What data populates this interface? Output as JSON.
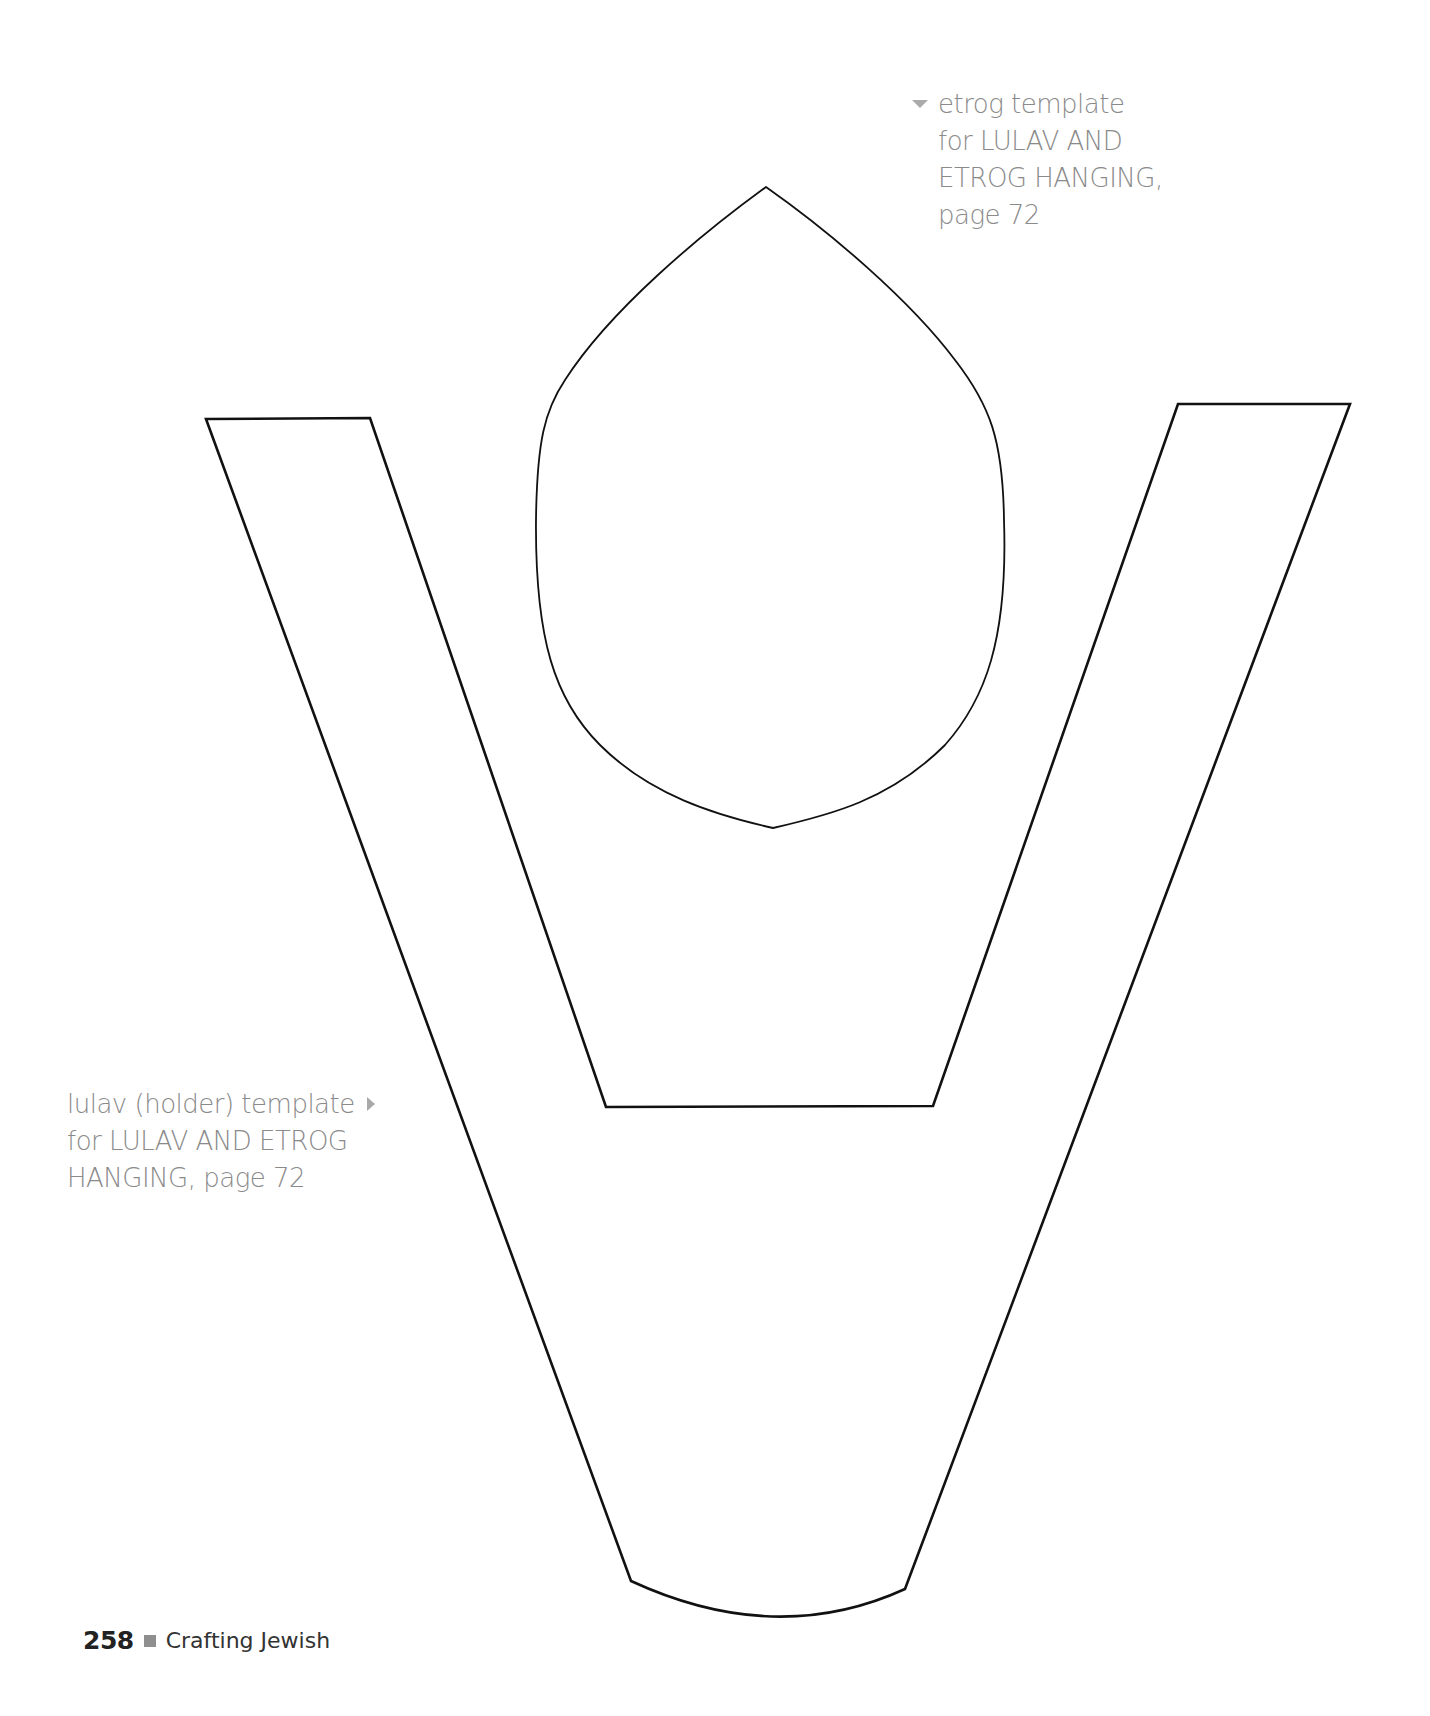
{
  "page": {
    "number": "258",
    "book_title": "Crafting Jewish",
    "separator_icon": "gray-square-icon"
  },
  "captions": {
    "etrog": {
      "pointer_icon": "triangle-down-icon",
      "lines": [
        "etrog template",
        "for LULAV AND",
        "ETROG HANGING,",
        "page 72"
      ]
    },
    "lulav": {
      "pointer_icon": "triangle-right-icon",
      "lines": [
        "lulav (holder) template",
        "for LULAV AND ETROG",
        "HANGING, page 72"
      ]
    }
  },
  "templates": {
    "etrog": {
      "shape": "pointed oval",
      "outline_color": "#111111"
    },
    "lulav_holder": {
      "shape": "V-shaped holder",
      "outline_color": "#111111"
    }
  },
  "colors": {
    "caption_text": "#8a8a8a",
    "pointer": "#aaaaaa",
    "page_number": "#222222",
    "footer_square": "#8f8f8f"
  }
}
